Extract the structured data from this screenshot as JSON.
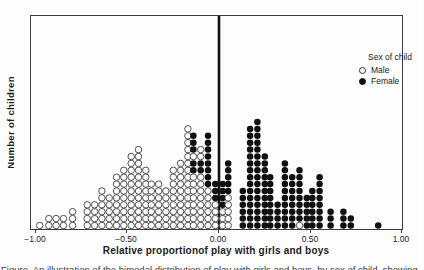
{
  "figure": {
    "y_axis_label": "Number of children",
    "x_axis_label": "Relative proportionof play with girls and boys",
    "x_ticks": [
      "−1.00",
      "−0.50",
      "0.00",
      "0.50",
      "1.00"
    ],
    "legend": {
      "title": "Sex of child",
      "items": [
        {
          "label": "Male",
          "marker": "open-circle"
        },
        {
          "label": "Female",
          "marker": "filled-circle"
        }
      ]
    },
    "caption_partial": "Figure. An illustration of the bimodal distribution of play with girls and boys, by sex of child, showing the offset of the two sexes."
  },
  "chart_data": {
    "type": "scatter",
    "subtype": "stacked-dot-histogram",
    "title": "",
    "xlabel": "Relative proportionof play with girls and boys",
    "ylabel": "Number of children",
    "xlim": [
      -1.0,
      1.0
    ],
    "x_tick_values": [
      -1.0,
      -0.5,
      0.0,
      0.5,
      1.0
    ],
    "grid": false,
    "zero_reference_line": true,
    "legend_position": "top-right-inside",
    "encoding": "Each column is one x-bin; 'stack' lists dots bottom-to-top. W = Male (open circle), B = Female (filled circle). Column height = number of children.",
    "colors": {
      "dot_open_fill": "#fdfdfd",
      "dot_outline": "#3d3d3d",
      "dot_filled": "#101010",
      "axis": "#3c3c3c"
    },
    "columns": [
      {
        "x": -0.98,
        "stack": "W"
      },
      {
        "x": -0.93,
        "stack": "WW"
      },
      {
        "x": -0.89,
        "stack": "WW"
      },
      {
        "x": -0.85,
        "stack": "WW"
      },
      {
        "x": -0.8,
        "stack": "WWW"
      },
      {
        "x": -0.72,
        "stack": "WWWW"
      },
      {
        "x": -0.68,
        "stack": "WWWW"
      },
      {
        "x": -0.64,
        "stack": "WWWWWW"
      },
      {
        "x": -0.6,
        "stack": "WWWWW"
      },
      {
        "x": -0.56,
        "stack": "WWWWWWWW"
      },
      {
        "x": -0.52,
        "stack": "WWWWWWWWW"
      },
      {
        "x": -0.48,
        "stack": "WWWWWWWWWWW"
      },
      {
        "x": -0.44,
        "stack": "WWWWWWWWWWWW"
      },
      {
        "x": -0.4,
        "stack": "WWWWWWWWW"
      },
      {
        "x": -0.37,
        "stack": "WWWWWWW"
      },
      {
        "x": -0.33,
        "stack": "WWWWWWW"
      },
      {
        "x": -0.29,
        "stack": "WWWWWW"
      },
      {
        "x": -0.25,
        "stack": "WWWWWWWWW"
      },
      {
        "x": -0.21,
        "stack": "WWWWWWWWWW"
      },
      {
        "x": -0.17,
        "stack": "WWWWWWWWWWWWWWW"
      },
      {
        "x": -0.14,
        "stack": "WWWWWWWWBBWBBB"
      },
      {
        "x": -0.1,
        "stack": "WWWWWWWWBBWW"
      },
      {
        "x": -0.06,
        "stack": "WWWWWWBBBBBBBB"
      },
      {
        "x": -0.02,
        "stack": "WWWWBBB"
      },
      {
        "x": 0.02,
        "stack": "WWWBBBB"
      },
      {
        "x": 0.05,
        "stack": "WWWWWBBBBB"
      },
      {
        "x": 0.13,
        "stack": "BBBBBB"
      },
      {
        "x": 0.17,
        "stack": "BBBBBBBBBBBBBBB"
      },
      {
        "x": 0.21,
        "stack": "BBBBBBBBBBBBBBBB"
      },
      {
        "x": 0.25,
        "stack": "BBBBBBBBBBB"
      },
      {
        "x": 0.28,
        "stack": "BBBBBBBB"
      },
      {
        "x": 0.32,
        "stack": "BBBB"
      },
      {
        "x": 0.36,
        "stack": "BBBBBBBBBB"
      },
      {
        "x": 0.4,
        "stack": "BBBBBBBB"
      },
      {
        "x": 0.44,
        "stack": "WBBBBBBBB"
      },
      {
        "x": 0.48,
        "stack": "BBBBB"
      },
      {
        "x": 0.51,
        "stack": "BBBBBB"
      },
      {
        "x": 0.55,
        "stack": "BBBBBBBB"
      },
      {
        "x": 0.61,
        "stack": "BBB"
      },
      {
        "x": 0.68,
        "stack": "BBB"
      },
      {
        "x": 0.72,
        "stack": "BB"
      },
      {
        "x": 0.87,
        "stack": "B"
      }
    ]
  }
}
